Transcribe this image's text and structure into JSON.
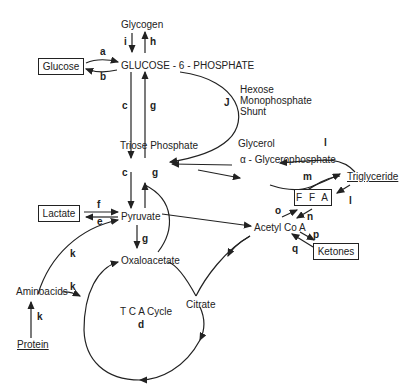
{
  "nodes": {
    "glycogen": "Glycogen",
    "glucose": "Glucose",
    "g6p": "GLUCOSE - 6 - PHOSPHATE",
    "hmp_line1": "Hexose",
    "hmp_line2": "Monophosphate",
    "hmp_line3": "Shunt",
    "triose": "Triose  Phosphate",
    "glycerol": "Glycerol",
    "glycerophosphate": "α - Glycerophosphate",
    "triglyceride": "Triglyceride",
    "ffa": "F F A",
    "lactate": "Lactate",
    "pyruvate": "Pyruvate",
    "acetylcoa": "Acetyl  Co A",
    "ketones": "Ketones",
    "oxaloacetate": "Oxaloacetate",
    "aminoacids": "Aminoacids",
    "citrate": "Citrate",
    "tca": "T C A  Cycle",
    "protein": "Protein"
  },
  "labels": {
    "a": "a",
    "b": "b",
    "c1": "c",
    "c2": "c",
    "d": "d",
    "e": "e",
    "f": "f",
    "g1": "g",
    "g2": "g",
    "g3": "g",
    "h": "h",
    "i": "i",
    "j": "J",
    "k1": "k",
    "k2": "k",
    "k3": "k",
    "l1": "l",
    "l2": "l",
    "m": "m",
    "n": "n",
    "o": "o",
    "p": "p",
    "q": "q"
  }
}
